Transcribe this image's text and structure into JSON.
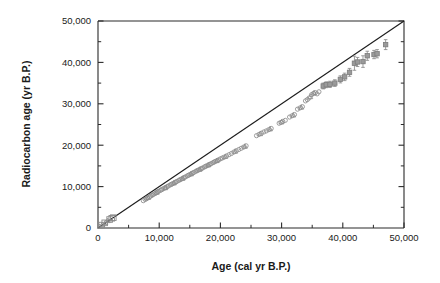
{
  "figure": {
    "name": "radiocarbon-calibration-scatter"
  },
  "chart_data": {
    "type": "scatter",
    "title": "",
    "xlabel": "Age (cal yr B.P.)",
    "ylabel": "Radiocarbon age (yr B.P.)",
    "xlim": [
      0,
      50000
    ],
    "ylim": [
      0,
      50000
    ],
    "grid": false,
    "legend": null,
    "xticks": [
      0,
      10000,
      20000,
      30000,
      40000,
      50000
    ],
    "xtick_labels": [
      "0",
      "10,000",
      "20,000",
      "30,000",
      "40,000",
      "50,000"
    ],
    "yticks": [
      0,
      10000,
      20000,
      30000,
      40000,
      50000
    ],
    "ytick_labels": [
      "0",
      "10,000",
      "20,000",
      "30,000",
      "40,000",
      "50,000"
    ],
    "minor_tick_interval": 5000,
    "tick_direction": "in",
    "marker_color": "#8d8d8d",
    "reference_line": {
      "label": "1:1 line",
      "from": [
        0,
        0
      ],
      "to": [
        50000,
        50000
      ],
      "color": "#1c1c1c"
    },
    "series": [
      {
        "name": "squares-low",
        "marker": "square",
        "points": [
          [
            600,
            700
          ],
          [
            1100,
            1250
          ],
          [
            1900,
            2050
          ],
          [
            2250,
            2350
          ],
          [
            2500,
            2500
          ]
        ]
      },
      {
        "name": "triangles-low",
        "marker": "triangle",
        "points": [
          [
            300,
            350
          ],
          [
            700,
            800
          ],
          [
            1200,
            1300
          ],
          [
            1600,
            1750
          ]
        ]
      },
      {
        "name": "circles-main",
        "marker": "circle",
        "points": [
          [
            7400,
            6600
          ],
          [
            7700,
            6900
          ],
          [
            7900,
            7050
          ],
          [
            8100,
            7250
          ],
          [
            8400,
            7500
          ],
          [
            8600,
            7700
          ],
          [
            8800,
            7900
          ],
          [
            9000,
            8050
          ],
          [
            9300,
            8300
          ],
          [
            9500,
            8500
          ],
          [
            9700,
            8700
          ],
          [
            9900,
            8850
          ],
          [
            10200,
            9100
          ],
          [
            10400,
            9250
          ],
          [
            10600,
            9450
          ],
          [
            10900,
            9650
          ],
          [
            11100,
            9800
          ],
          [
            11300,
            10000
          ],
          [
            11500,
            10150
          ],
          [
            11800,
            10400
          ],
          [
            12000,
            10550
          ],
          [
            12200,
            10700
          ],
          [
            12500,
            10950
          ],
          [
            12700,
            11100
          ],
          [
            12900,
            11250
          ],
          [
            13200,
            11500
          ],
          [
            13400,
            11650
          ],
          [
            13600,
            11800
          ],
          [
            13900,
            12050
          ],
          [
            14100,
            12200
          ],
          [
            14300,
            12350
          ],
          [
            14600,
            12600
          ],
          [
            14800,
            12750
          ],
          [
            15000,
            12900
          ],
          [
            15300,
            13150
          ],
          [
            15500,
            13300
          ],
          [
            15700,
            13450
          ],
          [
            16000,
            13700
          ],
          [
            16200,
            13850
          ],
          [
            16400,
            14000
          ],
          [
            16700,
            14200
          ],
          [
            16900,
            14350
          ],
          [
            17100,
            14500
          ],
          [
            17400,
            14750
          ],
          [
            17600,
            14900
          ],
          [
            17800,
            15050
          ],
          [
            18100,
            15250
          ],
          [
            18300,
            15400
          ],
          [
            18500,
            15550
          ],
          [
            18800,
            15800
          ],
          [
            19000,
            15950
          ],
          [
            19200,
            16100
          ],
          [
            19500,
            16300
          ],
          [
            19700,
            16450
          ],
          [
            20000,
            16700
          ],
          [
            20300,
            16900
          ],
          [
            20600,
            17100
          ],
          [
            21000,
            17400
          ],
          [
            21400,
            17700
          ],
          [
            21800,
            18000
          ],
          [
            22200,
            18350
          ],
          [
            22600,
            18650
          ],
          [
            23000,
            18950
          ],
          [
            23400,
            19250
          ],
          [
            23800,
            19550
          ],
          [
            24200,
            19850
          ],
          [
            25900,
            22300
          ],
          [
            26300,
            22600
          ],
          [
            26700,
            22900
          ],
          [
            27100,
            23200
          ],
          [
            27500,
            23450
          ],
          [
            27900,
            23750
          ],
          [
            28300,
            24050
          ],
          [
            29600,
            25300
          ],
          [
            29900,
            25500
          ],
          [
            30200,
            25750
          ],
          [
            30600,
            26000
          ],
          [
            31300,
            26800
          ],
          [
            31700,
            27100
          ],
          [
            32100,
            27400
          ],
          [
            32600,
            28700
          ],
          [
            33000,
            29000
          ],
          [
            33400,
            29300
          ],
          [
            33900,
            30700
          ],
          [
            34200,
            31000
          ],
          [
            34500,
            31400
          ],
          [
            34900,
            32200
          ],
          [
            35200,
            32500
          ],
          [
            35500,
            32700
          ],
          [
            35800,
            32400
          ],
          [
            36100,
            32900
          ]
        ]
      },
      {
        "name": "triangles-main",
        "marker": "triangle",
        "points": [
          [
            8200,
            7350
          ],
          [
            9600,
            8600
          ],
          [
            11000,
            9700
          ],
          [
            12400,
            10850
          ],
          [
            13800,
            11950
          ],
          [
            15200,
            13050
          ],
          [
            16600,
            14150
          ],
          [
            18000,
            15200
          ],
          [
            19400,
            16250
          ],
          [
            20800,
            17250
          ],
          [
            22400,
            18500
          ],
          [
            24000,
            19700
          ],
          [
            26500,
            22750
          ],
          [
            28100,
            23900
          ],
          [
            30000,
            25600
          ],
          [
            31900,
            27250
          ],
          [
            33200,
            29150
          ],
          [
            34700,
            31700
          ],
          [
            35300,
            32600
          ]
        ]
      },
      {
        "name": "squares-high-errorbars",
        "marker": "square-filled",
        "points": [
          [
            36800,
            34300
          ],
          [
            37300,
            34600
          ],
          [
            37900,
            34700
          ],
          [
            38700,
            35000
          ],
          [
            39600,
            35900
          ],
          [
            40300,
            36500
          ],
          [
            41100,
            37600
          ],
          [
            41900,
            39800
          ],
          [
            42400,
            40100
          ],
          [
            43300,
            40200
          ],
          [
            44000,
            41600
          ],
          [
            45100,
            41900
          ],
          [
            45600,
            42100
          ],
          [
            47000,
            44300
          ]
        ],
        "yerr": [
          700,
          700,
          750,
          800,
          850,
          900,
          950,
          1700,
          1100,
          1400,
          1100,
          1000,
          1000,
          1200
        ]
      }
    ]
  }
}
